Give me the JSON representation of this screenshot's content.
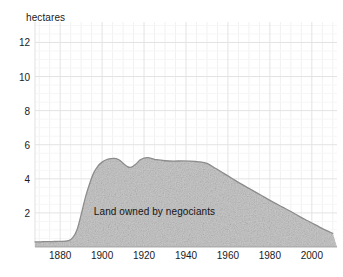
{
  "chart_data": {
    "type": "area",
    "title": "",
    "subtitle": "",
    "xlabel": "",
    "ylabel": "hectares",
    "ylim": [
      0,
      13.2
    ],
    "xlim": [
      1868,
      2012
    ],
    "grid": true,
    "grid_minor": true,
    "legend_position": "inline-annotation",
    "yticks": [
      2,
      4,
      6,
      8,
      10,
      12
    ],
    "ytick_labels": [
      "2",
      "4",
      "6",
      "8",
      "10",
      "12"
    ],
    "xticks": [
      1880,
      1900,
      1920,
      1940,
      1960,
      1980,
      2000
    ],
    "xtick_labels": [
      "1880",
      "1900",
      "1920",
      "1940",
      "1960",
      "1980",
      "2000"
    ],
    "annotations": [
      {
        "text": "Land owned by negociants",
        "x": 1925,
        "y": 2.1
      }
    ],
    "series": [
      {
        "name": "Land owned by negociants",
        "fill_color": "#c9c9c9",
        "line_color": "#8c8c8c",
        "x": [
          1868,
          1872,
          1876,
          1880,
          1884,
          1886,
          1888,
          1890,
          1892,
          1894,
          1896,
          1898,
          1900,
          1902,
          1904,
          1906,
          1908,
          1910,
          1912,
          1914,
          1916,
          1918,
          1920,
          1922,
          1924,
          1926,
          1930,
          1934,
          1938,
          1942,
          1946,
          1950,
          1954,
          1958,
          1962,
          1966,
          1970,
          1974,
          1978,
          1982,
          1986,
          1990,
          1994,
          1998,
          2002,
          2006,
          2010
        ],
        "y": [
          0.3,
          0.31,
          0.32,
          0.33,
          0.38,
          0.55,
          1.0,
          1.9,
          2.9,
          3.7,
          4.35,
          4.75,
          4.98,
          5.12,
          5.18,
          5.2,
          5.12,
          4.92,
          4.72,
          4.68,
          4.85,
          5.1,
          5.22,
          5.24,
          5.18,
          5.12,
          5.06,
          5.04,
          5.05,
          5.04,
          5.0,
          4.9,
          4.62,
          4.32,
          4.02,
          3.72,
          3.44,
          3.16,
          2.88,
          2.6,
          2.34,
          2.08,
          1.8,
          1.54,
          1.28,
          1.02,
          0.8
        ]
      }
    ]
  }
}
